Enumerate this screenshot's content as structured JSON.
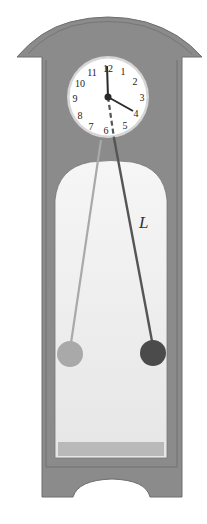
{
  "figure": {
    "length_label": "L",
    "clock_numerals": [
      "12",
      "1",
      "2",
      "3",
      "4",
      "5",
      "6",
      "7",
      "8",
      "9",
      "10",
      "11"
    ],
    "time_shown": "4:00",
    "pendulum_positions": [
      {
        "name": "left-extreme",
        "shade": "light",
        "color": "#a9a9a9"
      },
      {
        "name": "right-extreme",
        "shade": "dark",
        "color": "#4b4b4b"
      }
    ]
  },
  "colors": {
    "case": "#8b8b8b",
    "case_outline": "#6e6e6e",
    "window": "#ececec",
    "window_floor": "#b9b9b9",
    "clock_face": "#ffffff",
    "clock_ring": "#d6d6d6",
    "hands": "#2a2a2a"
  }
}
